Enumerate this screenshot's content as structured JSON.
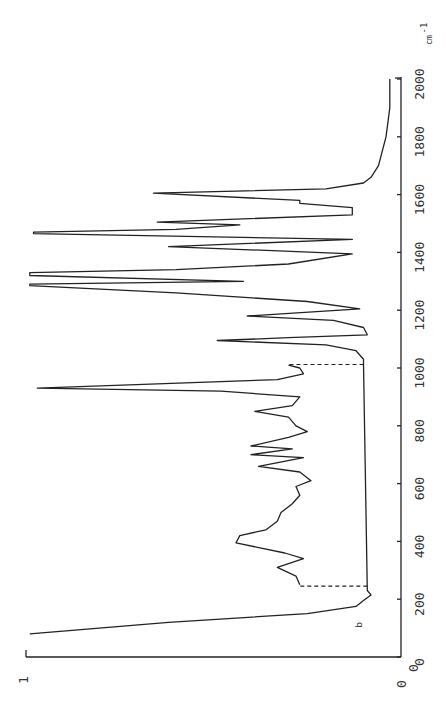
{
  "chart_data": {
    "type": "line",
    "title": "",
    "orientation": "rotated 90 degrees clockwise (wavenumber axis vertical on right, intensity horizontal)",
    "xlabel": "cm^-1",
    "ylabel": "",
    "xlim": [
      0,
      2000
    ],
    "ylim": [
      0,
      1
    ],
    "x_ticks": [
      0,
      200,
      400,
      600,
      800,
      1000,
      1200,
      1400,
      1600,
      1800,
      2000
    ],
    "x_tick_labels": [
      "0",
      "200",
      "400",
      "600",
      "800",
      "1000",
      "1200",
      "1400",
      "1600",
      "1800",
      "2000"
    ],
    "y_ticks": [
      0,
      1
    ],
    "y_tick_labels": [
      "0",
      "1"
    ],
    "unit_label": "cm",
    "unit_exponent": "-1",
    "annotation": "b",
    "grid": false,
    "legend": null,
    "series": [
      {
        "name": "spectrum b",
        "style": "solid",
        "x": [
          80,
          120,
          150,
          175,
          195,
          215,
          230,
          1015,
          1030,
          1060,
          1080,
          1095,
          1105,
          1115,
          1140,
          1165,
          1180,
          1205,
          1230,
          1260,
          1285,
          1290,
          1300,
          1320,
          1330,
          1340,
          1360,
          1395,
          1420,
          1445,
          1465,
          1470,
          1480,
          1495,
          1505,
          1530,
          1555,
          1570,
          1580,
          1605,
          1620,
          1640,
          1660,
          1700,
          1800,
          1900,
          2000
        ],
        "y": [
          0.99,
          0.62,
          0.25,
          0.12,
          0.1,
          0.08,
          0.09,
          0.1,
          0.1,
          0.12,
          0.2,
          0.49,
          0.3,
          0.09,
          0.1,
          0.18,
          0.41,
          0.11,
          0.25,
          0.6,
          0.99,
          0.99,
          0.42,
          0.99,
          0.99,
          0.6,
          0.3,
          0.13,
          0.62,
          0.13,
          0.98,
          0.98,
          0.6,
          0.43,
          0.65,
          0.13,
          0.13,
          0.27,
          0.27,
          0.66,
          0.2,
          0.1,
          0.08,
          0.06,
          0.04,
          0.03,
          0.03
        ]
      },
      {
        "name": "spectrum segment 250-1000",
        "style": "solid",
        "x": [
          250,
          280,
          310,
          340,
          360,
          395,
          420,
          440,
          470,
          500,
          530,
          560,
          590,
          610,
          640,
          660,
          690,
          700,
          720,
          730,
          760,
          780,
          800,
          830,
          850,
          870,
          900,
          920,
          930,
          960,
          980,
          1000,
          1010
        ],
        "y": [
          0.27,
          0.28,
          0.33,
          0.26,
          0.31,
          0.44,
          0.43,
          0.36,
          0.33,
          0.32,
          0.29,
          0.27,
          0.28,
          0.24,
          0.27,
          0.38,
          0.26,
          0.4,
          0.29,
          0.4,
          0.3,
          0.25,
          0.28,
          0.3,
          0.39,
          0.29,
          0.27,
          0.48,
          0.97,
          0.33,
          0.26,
          0.27,
          0.3
        ]
      },
      {
        "name": "connector at 250",
        "style": "dashed",
        "x": [
          245,
          245
        ],
        "y": [
          0.09,
          0.27
        ]
      },
      {
        "name": "connector at 1010",
        "style": "dashed",
        "x": [
          1012,
          1012
        ],
        "y": [
          0.1,
          0.3
        ]
      }
    ]
  }
}
